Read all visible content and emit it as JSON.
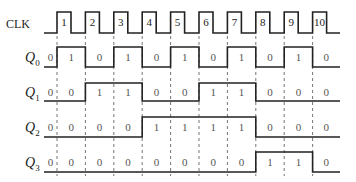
{
  "diagram": {
    "type": "timing-diagram",
    "signals": [
      {
        "name": "CLK",
        "label": "CLK",
        "sub": ""
      },
      {
        "name": "Q0",
        "label": "Q",
        "sub": "0"
      },
      {
        "name": "Q1",
        "label": "Q",
        "sub": "1"
      },
      {
        "name": "Q2",
        "label": "Q",
        "sub": "2"
      },
      {
        "name": "Q3",
        "label": "Q",
        "sub": "3"
      }
    ],
    "clock_pulses": [
      "1",
      "2",
      "3",
      "4",
      "5",
      "6",
      "7",
      "8",
      "9",
      "10"
    ],
    "states": {
      "Q0": [
        "0",
        "1",
        "0",
        "1",
        "0",
        "1",
        "0",
        "1",
        "0",
        "1",
        "0"
      ],
      "Q1": [
        "0",
        "0",
        "1",
        "1",
        "0",
        "0",
        "1",
        "1",
        "0",
        "0",
        "0"
      ],
      "Q2": [
        "0",
        "0",
        "0",
        "0",
        "1",
        "1",
        "1",
        "1",
        "0",
        "0",
        "0"
      ],
      "Q3": [
        "0",
        "0",
        "0",
        "0",
        "0",
        "0",
        "0",
        "0",
        "1",
        "1",
        "0"
      ]
    },
    "colors": {
      "line": "#222222",
      "grid": "#666666",
      "text": "#222222"
    }
  }
}
